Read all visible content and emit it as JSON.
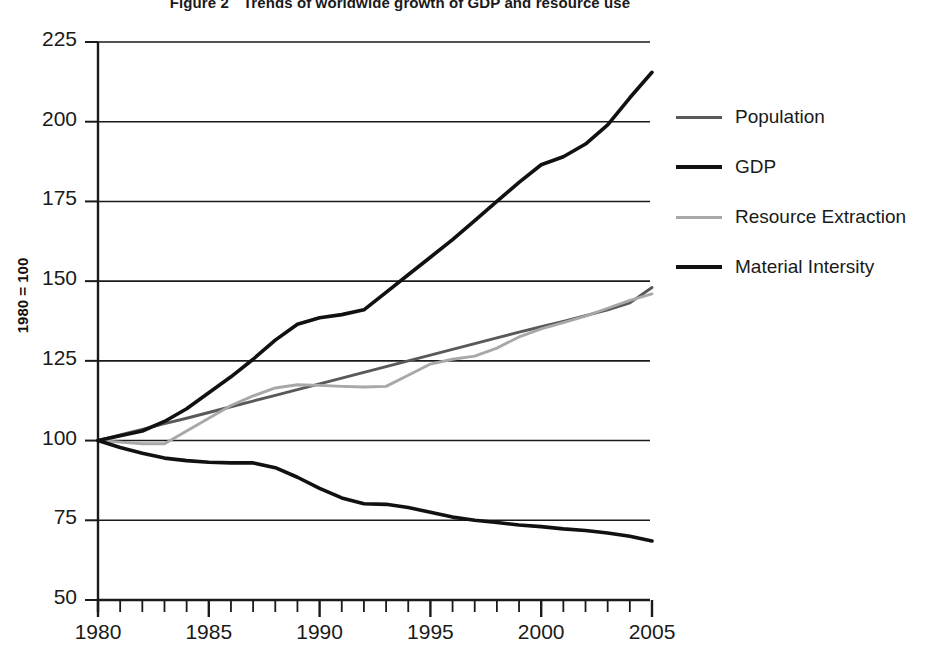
{
  "figure": {
    "number_label": "Figure 2",
    "title": "Trends of worldwide growth of GDP and resource use"
  },
  "axes": {
    "y_axis_title": "1980 = 100",
    "y_ticks": [
      "225",
      "200",
      "175",
      "150",
      "125",
      "100",
      "75",
      "50"
    ],
    "x_ticks": [
      "1980",
      "1985",
      "1990",
      "1995",
      "2000",
      "2005"
    ]
  },
  "legend": {
    "items": [
      {
        "label": "Population",
        "color": "#595959",
        "width": 3
      },
      {
        "label": "GDP",
        "color": "#111111",
        "width": 4
      },
      {
        "label": "Resource Extraction",
        "color": "#a8a8a8",
        "width": 3
      },
      {
        "label": "Material Intersity",
        "color": "#111111",
        "width": 4
      }
    ]
  },
  "chart_data": {
    "type": "line",
    "xlabel": "",
    "ylabel": "1980 = 100",
    "xlim": [
      1980,
      2005
    ],
    "ylim": [
      50,
      225
    ],
    "y_tick_values": [
      50,
      75,
      100,
      125,
      150,
      175,
      200,
      225
    ],
    "x_tick_values": [
      1980,
      1985,
      1990,
      1995,
      2000,
      2005
    ],
    "x_minor_tick_step": 1,
    "grid": "horizontal",
    "legend_position": "right",
    "x": [
      1980,
      1981,
      1982,
      1983,
      1984,
      1985,
      1986,
      1987,
      1988,
      1989,
      1990,
      1991,
      1992,
      1993,
      1994,
      1995,
      1996,
      1997,
      1998,
      1999,
      2000,
      2001,
      2002,
      2003,
      2004,
      2005
    ],
    "series": [
      {
        "name": "Population",
        "color": "#595959",
        "values": [
          100,
          101.8,
          103.5,
          105.3,
          107.0,
          108.8,
          110.6,
          112.4,
          114.2,
          116.0,
          117.8,
          119.6,
          121.4,
          123.2,
          125.0,
          126.8,
          128.6,
          130.4,
          132.2,
          134.0,
          135.7,
          137.4,
          139.2,
          141.0,
          143.2,
          148.0
        ]
      },
      {
        "name": "GDP",
        "color": "#111111",
        "values": [
          100,
          101.5,
          103.0,
          106.0,
          110.0,
          115.0,
          120.0,
          125.5,
          131.5,
          136.5,
          138.5,
          139.5,
          141.0,
          146.5,
          152.0,
          157.5,
          163.0,
          169.0,
          175.0,
          181.0,
          186.5,
          189.0,
          193.0,
          199.0,
          207.5,
          215.5
        ]
      },
      {
        "name": "Resource Extraction",
        "color": "#a8a8a8",
        "values": [
          100,
          99.5,
          99.0,
          99.0,
          103.0,
          107.0,
          111.0,
          114.0,
          116.5,
          117.5,
          117.3,
          117.0,
          116.8,
          117.0,
          120.5,
          124.0,
          125.5,
          126.5,
          129.0,
          132.5,
          135.0,
          137.0,
          139.0,
          141.5,
          144.0,
          146.0
        ]
      },
      {
        "name": "Material Intersity",
        "color": "#111111",
        "values": [
          100,
          97.8,
          96.0,
          94.5,
          93.7,
          93.2,
          93.0,
          93.0,
          91.5,
          88.5,
          85.0,
          82.0,
          80.2,
          80.0,
          79.0,
          77.5,
          76.0,
          75.0,
          74.3,
          73.5,
          73.0,
          72.3,
          71.8,
          71.0,
          70.0,
          68.5
        ]
      }
    ]
  }
}
